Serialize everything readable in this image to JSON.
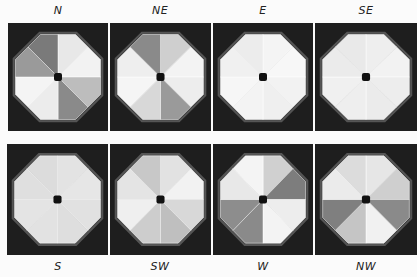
{
  "figure": {
    "panels": [
      {
        "label": "N",
        "row": 0,
        "col": 0,
        "shades": [
          "#e8e8e8",
          "#f2f2f2",
          "#bdbdbd",
          "#8a8a8a",
          "#ececec",
          "#f4f4f4",
          "#9a9a9a",
          "#7a7a7a"
        ]
      },
      {
        "label": "NE",
        "row": 0,
        "col": 1,
        "shades": [
          "#cfcfcf",
          "#f3f3f3",
          "#ededed",
          "#9a9a9a",
          "#d8d8d8",
          "#f5f5f5",
          "#eeeeee",
          "#8a8a8a"
        ]
      },
      {
        "label": "E",
        "row": 0,
        "col": 2,
        "shades": [
          "#f4f4f4",
          "#f7f7f7",
          "#f2f2f2",
          "#efefef",
          "#f3f3f3",
          "#f6f6f6",
          "#f0f0f0",
          "#ececec"
        ]
      },
      {
        "label": "SE",
        "row": 0,
        "col": 3,
        "shades": [
          "#eeeeee",
          "#f2f2f2",
          "#ededed",
          "#ebebeb",
          "#eeeeee",
          "#f0f0f0",
          "#ebebeb",
          "#e9e9e9"
        ]
      },
      {
        "label": "S",
        "row": 1,
        "col": 0,
        "shades": [
          "#e3e3e3",
          "#e6e6e6",
          "#e1e1e1",
          "#dedede",
          "#e2e2e2",
          "#e4e4e4",
          "#dfdfdf",
          "#dcdcdc"
        ]
      },
      {
        "label": "SW",
        "row": 1,
        "col": 1,
        "shades": [
          "#e2e2e2",
          "#f2f2f2",
          "#d8d8d8",
          "#bfbfbf",
          "#cdcdcd",
          "#efefef",
          "#e4e4e4",
          "#c8c8c8"
        ]
      },
      {
        "label": "W",
        "row": 1,
        "col": 2,
        "shades": [
          "#d0d0d0",
          "#7d7d7d",
          "#ededed",
          "#f3f3f3",
          "#8a8a8a",
          "#8d8d8d",
          "#e8e8e8",
          "#f4f4f4"
        ]
      },
      {
        "label": "NW",
        "row": 1,
        "col": 3,
        "shades": [
          "#e6e6e6",
          "#cfcfcf",
          "#8a8a8a",
          "#f1f1f1",
          "#c5c5c5",
          "#7f7f7f",
          "#ebebeb",
          "#dcdcdc"
        ]
      }
    ]
  }
}
